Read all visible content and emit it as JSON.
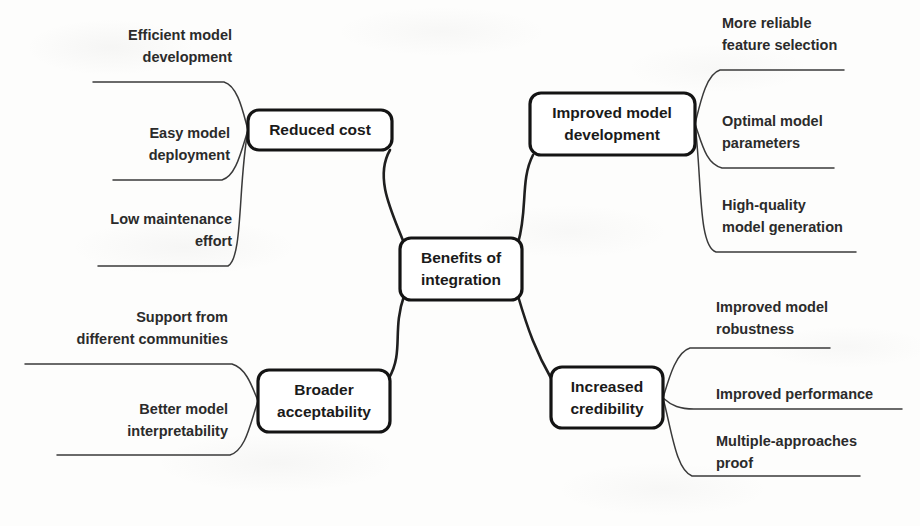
{
  "diagram": {
    "type": "mind-map",
    "title": "Benefits of integration",
    "center": {
      "id": "center",
      "label_line1": "Benefits of",
      "label_line2": "integration"
    },
    "branches": [
      {
        "id": "reduced-cost",
        "label_line1": "Reduced cost",
        "label_line2": "",
        "position": "top-left",
        "leaves": [
          {
            "id": "efficient-model-development",
            "line1": "Efficient model",
            "line2": "development"
          },
          {
            "id": "easy-model-deployment",
            "line1": "Easy model",
            "line2": "deployment"
          },
          {
            "id": "low-maintenance-effort",
            "line1": "Low maintenance",
            "line2": "effort"
          }
        ]
      },
      {
        "id": "improved-model-development",
        "label_line1": "Improved model",
        "label_line2": "development",
        "position": "top-right",
        "leaves": [
          {
            "id": "more-reliable-feature-selection",
            "line1": "More reliable",
            "line2": "feature selection"
          },
          {
            "id": "optimal-model-parameters",
            "line1": "Optimal model",
            "line2": "parameters"
          },
          {
            "id": "high-quality-model-generation",
            "line1": "High-quality",
            "line2": "model generation"
          }
        ]
      },
      {
        "id": "broader-acceptability",
        "label_line1": "Broader",
        "label_line2": "acceptability",
        "position": "bottom-left",
        "leaves": [
          {
            "id": "support-from-different-communities",
            "line1": "Support from",
            "line2": "different communities"
          },
          {
            "id": "better-model-interpretability",
            "line1": "Better model",
            "line2": "interpretability"
          }
        ]
      },
      {
        "id": "increased-credibility",
        "label_line1": "Increased",
        "label_line2": "credibility",
        "position": "bottom-right",
        "leaves": [
          {
            "id": "improved-model-robustness",
            "line1": "Improved model",
            "line2": "robustness"
          },
          {
            "id": "improved-performance",
            "line1": "Improved performance",
            "line2": ""
          },
          {
            "id": "multiple-approaches-proof",
            "line1": "Multiple-approaches",
            "line2": "proof"
          }
        ]
      }
    ],
    "colors": {
      "background": "#fdfdfc",
      "node_border": "#141414",
      "node_fill": "#ffffff",
      "text": "#1a1a1a",
      "leaf_text": "#2b2b2b",
      "connector": "#1f1f1f",
      "twig": "#3a3a3a"
    }
  }
}
